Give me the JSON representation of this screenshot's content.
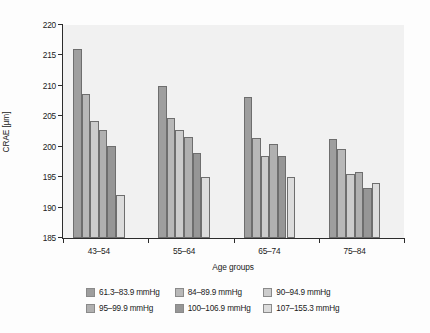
{
  "chart_data": {
    "type": "bar",
    "title": "",
    "subtitle": "",
    "xlabel": "Age groups",
    "ylabel": "CRAE [µm]",
    "categories": [
      "43–54",
      "55–64",
      "65–74",
      "75–84"
    ],
    "ylim": [
      185,
      220
    ],
    "yticks": [
      185,
      190,
      195,
      200,
      205,
      210,
      215,
      220
    ],
    "ytick_labels": [
      "185",
      "190",
      "195",
      "200",
      "205",
      "210",
      "215",
      "220"
    ],
    "grid": false,
    "legend_position": "bottom",
    "series": [
      {
        "name": "61.3–83.9 mmHg",
        "color": "#9e9e9e",
        "values": [
          216.0,
          209.9,
          208.2,
          201.3
        ]
      },
      {
        "name": "84–89.9 mmHg",
        "color": "#b8b8b8",
        "values": [
          208.6,
          204.8,
          201.5,
          199.7
        ]
      },
      {
        "name": "90–94.9 mmHg",
        "color": "#cccccc",
        "values": [
          204.3,
          202.7,
          198.4,
          195.5
        ]
      },
      {
        "name": "95–99.9 mmHg",
        "color": "#b0b0b0",
        "values": [
          202.7,
          201.6,
          200.4,
          195.9
        ]
      },
      {
        "name": "100–106.9 mmHg",
        "color": "#969696",
        "values": [
          200.2,
          198.9,
          198.5,
          193.3
        ]
      },
      {
        "name": "107–155.3 mmHg",
        "color": "#dcdcdc",
        "values": [
          192.1,
          195.0,
          195.0,
          194.0
        ]
      }
    ]
  }
}
